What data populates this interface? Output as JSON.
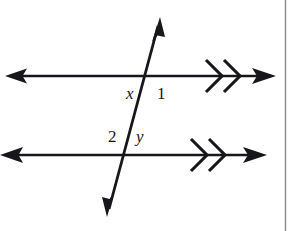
{
  "figure": {
    "name": "parallel-lines-transversal-diagram",
    "background_color": "#ffffff",
    "ink_color": "#17161a",
    "border_color": "#8a8a8a",
    "labels": [
      {
        "id": "x",
        "text": "x",
        "style": "italic"
      },
      {
        "id": "1",
        "text": "1",
        "style": "upright"
      },
      {
        "id": "2",
        "text": "2",
        "style": "upright"
      },
      {
        "id": "y",
        "text": "y",
        "style": "upright"
      }
    ],
    "lines": {
      "top_parallel": {
        "name": "top-parallel-line",
        "y": 76,
        "x_start": 5,
        "x_end": 275,
        "left_arrowhead": true,
        "right_arrowhead": true,
        "parallel_marks": 2
      },
      "bottom_parallel": {
        "name": "bottom-parallel-line",
        "y": 155,
        "x_start": 0,
        "x_end": 266,
        "left_arrowhead": true,
        "right_arrowhead": true,
        "parallel_marks": 2
      },
      "transversal": {
        "name": "transversal-line",
        "x_top": 160,
        "y_top": 18,
        "x_bottom": 107,
        "y_bottom": 216,
        "top_arrowhead": true,
        "bottom_arrowhead": true
      }
    },
    "intersections": {
      "upper": {
        "x": 146,
        "y": 76
      },
      "lower": {
        "x": 128,
        "y": 155
      }
    },
    "page_border": {
      "name": "page-border-rule",
      "x": 285,
      "orientation": "vertical"
    }
  }
}
